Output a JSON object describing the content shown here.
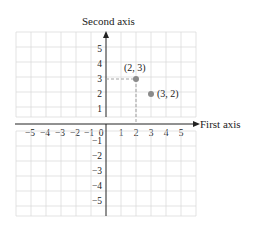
{
  "axes": {
    "x_label": "First axis",
    "y_label": "Second axis",
    "x_ticks": [
      "−5",
      "−4",
      "−3",
      "−2",
      "−1",
      "1",
      "2",
      "3",
      "4",
      "5"
    ],
    "y_ticks_pos": [
      "5",
      "4",
      "3",
      "2",
      "1"
    ],
    "y_ticks_neg": [
      "−1",
      "−2",
      "−3",
      "−4",
      "−5"
    ],
    "origin_label": "0",
    "range": [
      -6,
      6
    ]
  },
  "points": [
    {
      "label": "(2, 3)",
      "x": 2,
      "y": 3,
      "dashed_projection": true
    },
    {
      "label": "(3, 2)",
      "x": 3,
      "y": 2,
      "dashed_projection": false
    }
  ],
  "colors": {
    "grid": "#dcdcdc",
    "axis": "#222222",
    "point": "#8a8a8a",
    "dashed": "#999999",
    "point_label": "#777777"
  }
}
